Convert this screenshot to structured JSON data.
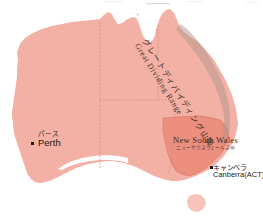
{
  "map": {
    "title": "Australia regional map",
    "background_color": "#ffffff",
    "land_color": "#f3b0a4",
    "highlight_color": "#ec8f7e",
    "border_color": "#d98a7c",
    "mountain_band_color": "#b59a92"
  },
  "cities": [
    {
      "id": "perth",
      "name_ja": "パース",
      "name_en": "Perth",
      "marker": "square-dot"
    },
    {
      "id": "canberra",
      "name_ja": "キャンベラ",
      "name_en": "Canberra(ACT)",
      "marker": "square-dot"
    }
  ],
  "regions": [
    {
      "id": "new-south-wales",
      "name_en": "New South Wales",
      "name_ja": "ニューサウスウェールズ州",
      "color": "#ec8f7e"
    }
  ],
  "features": [
    {
      "id": "great-dividing-range",
      "name_ja": "グレートディバイディング山脈",
      "name_en": "Great Dividing Range",
      "type": "mountain-range"
    }
  ]
}
